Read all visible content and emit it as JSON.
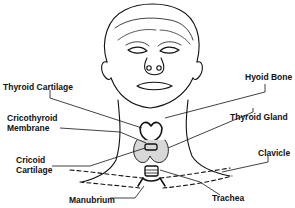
{
  "diagram": {
    "labels": {
      "thyroid_cartilage": "Thyroid Cartilage",
      "cricothyroid_membrane_line1": "Cricothyroid",
      "cricothyroid_membrane_line2": "Membrane",
      "cricoid_cartilage_line1": "Cricoid",
      "cricoid_cartilage_line2": "Cartilage",
      "manubrium": "Manubrium",
      "hyoid_bone": "Hyoid Bone",
      "thyroid_gland": "Thyroid Gland",
      "clavicle": "Clavicle",
      "trachea": "Trachea"
    },
    "colors": {
      "ink": "#111111",
      "background": "#ffffff",
      "gland_fill": "#d8d8d8"
    }
  }
}
